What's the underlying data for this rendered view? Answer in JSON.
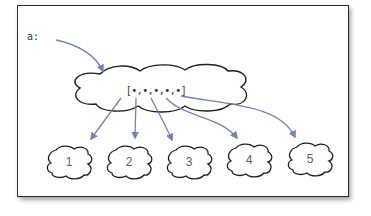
{
  "diagram": {
    "variable_label": "a:",
    "array_text": "[•,•,•,•,•]",
    "elements": [
      {
        "label": "1"
      },
      {
        "label": "2"
      },
      {
        "label": "3"
      },
      {
        "label": "4"
      },
      {
        "label": "5"
      }
    ],
    "colors": {
      "arrow": "#7b7fb5",
      "outline": "#1e1e1e",
      "text": "#333344",
      "element_text": "#5a5a8a"
    }
  }
}
